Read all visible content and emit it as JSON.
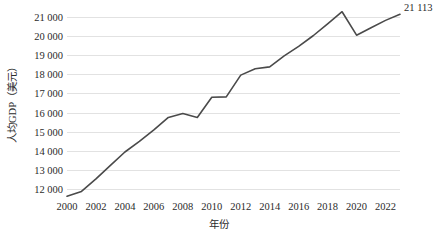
{
  "chart_data": {
    "type": "line",
    "title": "",
    "xlabel": "年份",
    "ylabel": "人均GDP（美元）",
    "xlim": [
      2000,
      2023
    ],
    "ylim": [
      11400,
      21600
    ],
    "grid": true,
    "legend": "none",
    "line_color": "#4a4a4a",
    "grid_color": "#e2e2e2",
    "y_tick_labels": [
      "21 000",
      "20 000",
      "19 000",
      "18 000",
      "17 000",
      "16 000",
      "15 000",
      "14 000",
      "13 000",
      "12 000"
    ],
    "y_tick_values": [
      21000,
      20000,
      19000,
      18000,
      17000,
      16000,
      15000,
      14000,
      13000,
      12000
    ],
    "x_tick_labels": [
      "2000",
      "2002",
      "2004",
      "2006",
      "2008",
      "2010",
      "2012",
      "2014",
      "2016",
      "2018",
      "2020",
      "2022"
    ],
    "x_tick_values": [
      2000,
      2002,
      2004,
      2006,
      2008,
      2010,
      2012,
      2014,
      2016,
      2018,
      2020,
      2022
    ],
    "x": [
      2000,
      2001,
      2002,
      2003,
      2004,
      2005,
      2006,
      2007,
      2008,
      2009,
      2010,
      2011,
      2012,
      2013,
      2014,
      2015,
      2016,
      2017,
      2018,
      2019,
      2020,
      2021,
      2022,
      2023
    ],
    "values": [
      11650,
      11900,
      12550,
      13250,
      13950,
      14500,
      15100,
      15750,
      15950,
      15750,
      16800,
      16820,
      17950,
      18280,
      18380,
      18950,
      19450,
      20000,
      20620,
      21250,
      20030,
      20420,
      20800,
      21113
    ],
    "annotations": [
      {
        "name": "end-value-label",
        "text": "21 113",
        "x": 2023,
        "y": 21113
      }
    ]
  }
}
